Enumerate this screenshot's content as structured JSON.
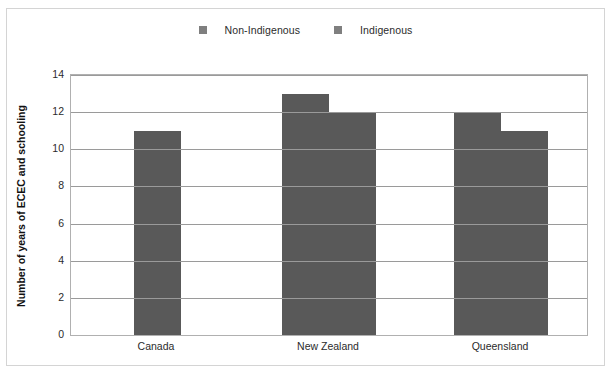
{
  "chart_data": {
    "type": "bar",
    "title": "",
    "xlabel": "",
    "ylabel": "Number of years of ECEC and schooling",
    "categories": [
      "Canada",
      "New Zealand",
      "Queensland"
    ],
    "series": [
      {
        "name": "Non-Indigenous",
        "values": [
          11,
          13,
          12
        ],
        "color": "#595959"
      },
      {
        "name": "Indigenous",
        "values": [
          null,
          12,
          11
        ],
        "color": "#595959"
      }
    ],
    "ylim": [
      0,
      14
    ],
    "yticks": [
      0,
      2,
      4,
      6,
      8,
      10,
      12,
      14
    ],
    "ytick_labels": [
      "0",
      "2",
      "4",
      "6",
      "8",
      "10",
      "12",
      "14"
    ],
    "grid": "horizontal",
    "legend_position": "top-center",
    "legend_marker": "square-swatch"
  },
  "legend": {
    "entries": [
      {
        "label": "Non-Indigenous",
        "swatch_name": "legend-swatch-non-indigenous"
      },
      {
        "label": "Indigenous",
        "swatch_name": "legend-swatch-indigenous"
      }
    ]
  },
  "colors": {
    "bar_fill": "#595959",
    "legend_swatch": "#7f7f7f",
    "gridline": "#9a9a9a",
    "plot_border": "#b0b0b0",
    "figure_border": "#d4d4d4",
    "text": "#2b2b2b"
  }
}
